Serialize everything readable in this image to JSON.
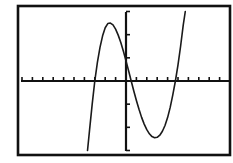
{
  "chart_data": {
    "type": "line",
    "title": "",
    "xlabel": "",
    "ylabel": "",
    "window": {
      "xmin": -10,
      "xmax": 10,
      "xscl": 1,
      "ymin": -3,
      "ymax": 3,
      "yscl": 1
    },
    "grid": false,
    "legend": null,
    "series": [
      {
        "name": "y1",
        "color": "#1a1a1a",
        "points": [
          [
            -3.7,
            -3.0
          ],
          [
            -3.5,
            -2.1
          ],
          [
            -3.25,
            -1.0
          ],
          [
            -3.0,
            0.0
          ],
          [
            -2.75,
            0.8
          ],
          [
            -2.5,
            1.45
          ],
          [
            -2.25,
            1.95
          ],
          [
            -2.0,
            2.3
          ],
          [
            -1.75,
            2.48
          ],
          [
            -1.5,
            2.5
          ],
          [
            -1.25,
            2.42
          ],
          [
            -1.0,
            2.24
          ],
          [
            -0.75,
            1.98
          ],
          [
            -0.5,
            1.66
          ],
          [
            -0.25,
            1.28
          ],
          [
            0.0,
            0.87
          ],
          [
            0.25,
            0.44
          ],
          [
            0.5,
            0.0
          ],
          [
            0.75,
            -0.43
          ],
          [
            1.0,
            -0.84
          ],
          [
            1.25,
            -1.22
          ],
          [
            1.5,
            -1.57
          ],
          [
            1.75,
            -1.86
          ],
          [
            2.0,
            -2.1
          ],
          [
            2.25,
            -2.28
          ],
          [
            2.5,
            -2.4
          ],
          [
            2.75,
            -2.45
          ],
          [
            3.0,
            -2.43
          ],
          [
            3.25,
            -2.34
          ],
          [
            3.5,
            -2.17
          ],
          [
            3.75,
            -1.92
          ],
          [
            4.0,
            -1.58
          ],
          [
            4.25,
            -1.14
          ],
          [
            4.5,
            -0.6
          ],
          [
            4.75,
            0.0
          ],
          [
            5.0,
            0.7
          ],
          [
            5.25,
            1.5
          ],
          [
            5.5,
            2.4
          ],
          [
            5.7,
            3.0
          ]
        ]
      }
    ],
    "x_ticks_count_each_side": 10,
    "y_ticks_count_each_side": 3
  },
  "colors": {
    "background": "#ffffff",
    "frame": "#111111",
    "axes": "#111111",
    "curve": "#1a1a1a"
  }
}
